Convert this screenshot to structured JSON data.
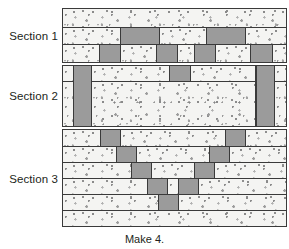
{
  "figure": {
    "caption": "Make 4.",
    "colors": {
      "gray_fabric": "#9b9b9b",
      "light_fabric": "#f4f4f2",
      "outline": "#3a3a3a",
      "text": "#231f20",
      "background": "#ffffff"
    }
  },
  "sections": [
    {
      "label": "Section 1",
      "strip_count": 3,
      "strips": [
        {
          "name": "section1-row1",
          "cells": [
            {
              "fabric": "light",
              "width": 100
            }
          ]
        },
        {
          "name": "section1-row2",
          "cells": [
            {
              "fabric": "light",
              "width": 26.0
            },
            {
              "fabric": "gray",
              "width": 17.5
            },
            {
              "fabric": "light",
              "width": 21.0
            },
            {
              "fabric": "gray",
              "width": 17.5
            },
            {
              "fabric": "light",
              "width": 18.0
            }
          ]
        },
        {
          "name": "section1-row3",
          "cells": [
            {
              "fabric": "light",
              "width": 16.5
            },
            {
              "fabric": "gray",
              "width": 9.5
            },
            {
              "fabric": "light",
              "width": 16.0
            },
            {
              "fabric": "gray",
              "width": 9.5
            },
            {
              "fabric": "light",
              "width": 7.5
            },
            {
              "fabric": "gray",
              "width": 9.5
            },
            {
              "fabric": "light",
              "width": 16.0
            },
            {
              "fabric": "gray",
              "width": 9.5
            },
            {
              "fabric": "light",
              "width": 6.0
            }
          ]
        }
      ]
    },
    {
      "label": "Section 2",
      "strip_count": 2,
      "strips": [
        {
          "name": "section2-row1",
          "cells": [
            {
              "fabric": "light",
              "width": 4.5
            },
            {
              "fabric": "gray",
              "width": 8.5
            },
            {
              "fabric": "light",
              "width": 35.0
            },
            {
              "fabric": "gray",
              "width": 9.5
            },
            {
              "fabric": "light",
              "width": 29.0
            },
            {
              "fabric": "gray",
              "width": 8.5
            },
            {
              "fabric": "light",
              "width": 5.0
            }
          ]
        },
        {
          "name": "section2-row2",
          "cells": [
            {
              "fabric": "light",
              "width": 4.5
            },
            {
              "fabric": "gray",
              "width": 8.5
            },
            {
              "fabric": "light",
              "width": 73.5
            },
            {
              "fabric": "gray",
              "width": 8.5
            },
            {
              "fabric": "light",
              "width": 5.0
            }
          ]
        }
      ],
      "vertical_bars": [
        {
          "name": "section2-left-bar",
          "left_pct": 4.5,
          "width_pct": 8.5
        },
        {
          "name": "section2-right-bar",
          "left_pct": 86.5,
          "width_pct": 8.5
        }
      ]
    },
    {
      "label": "Section 3",
      "strip_count": 6,
      "strips": [
        {
          "name": "section3-row1",
          "cells": [
            {
              "fabric": "light",
              "width": 17.0
            },
            {
              "fabric": "gray",
              "width": 9.0
            },
            {
              "fabric": "light",
              "width": 47.0
            },
            {
              "fabric": "gray",
              "width": 9.0
            },
            {
              "fabric": "light",
              "width": 18.0
            }
          ]
        },
        {
          "name": "section3-row2",
          "cells": [
            {
              "fabric": "light",
              "width": 24.0
            },
            {
              "fabric": "gray",
              "width": 9.0
            },
            {
              "fabric": "light",
              "width": 33.0
            },
            {
              "fabric": "gray",
              "width": 9.0
            },
            {
              "fabric": "light",
              "width": 25.0
            }
          ]
        },
        {
          "name": "section3-row3",
          "cells": [
            {
              "fabric": "light",
              "width": 31.0
            },
            {
              "fabric": "gray",
              "width": 9.0
            },
            {
              "fabric": "light",
              "width": 19.0
            },
            {
              "fabric": "gray",
              "width": 9.0
            },
            {
              "fabric": "light",
              "width": 32.0
            }
          ]
        },
        {
          "name": "section3-row4",
          "cells": [
            {
              "fabric": "light",
              "width": 38.0
            },
            {
              "fabric": "gray",
              "width": 9.0
            },
            {
              "fabric": "light",
              "width": 5.0
            },
            {
              "fabric": "gray",
              "width": 9.0
            },
            {
              "fabric": "light",
              "width": 39.0
            }
          ]
        },
        {
          "name": "section3-row5",
          "cells": [
            {
              "fabric": "light",
              "width": 43.0
            },
            {
              "fabric": "gray",
              "width": 9.0
            },
            {
              "fabric": "light",
              "width": 48.0
            }
          ]
        },
        {
          "name": "section3-row6",
          "cells": [
            {
              "fabric": "light",
              "width": 100
            }
          ]
        }
      ]
    }
  ]
}
